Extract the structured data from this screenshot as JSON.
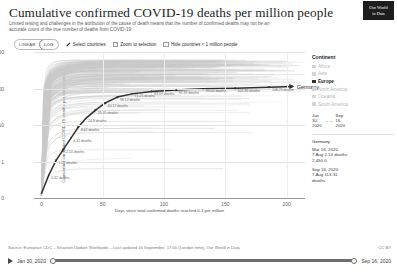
{
  "header": {
    "title": "Cumulative confirmed COVID-19 deaths per million people",
    "subtitle": "Limited testing and challenges in the attribution of the cause of death means that the number of confirmed deaths may not be an accurate count of the true number of deaths from COVID-19.",
    "logo_line1": "Our World",
    "logo_line2": "in Data"
  },
  "controls": {
    "scale_linear": "LINEAR",
    "scale_log": "LOG",
    "scale_selected": "LOG",
    "select_countries": "Select countries",
    "zoom_to_selection": "Zoom to selection",
    "hide_small_countries": "Hide countries < 1 million people",
    "zoom_checked": false,
    "hide_checked": false
  },
  "panel": {
    "legend_title": "Continent",
    "legend_items": [
      {
        "label": "Africa",
        "active": false
      },
      {
        "label": "Asia",
        "active": false
      },
      {
        "label": "Europe",
        "active": true
      },
      {
        "label": "North America",
        "active": false
      },
      {
        "label": "Oceania",
        "active": false
      },
      {
        "label": "South America",
        "active": false
      }
    ],
    "range_start_month": "Jan",
    "range_start_day": "30,",
    "range_start_year": "2020",
    "range_arrow": "←→",
    "range_end_month": "Sep",
    "range_end_day": "16,",
    "range_end_year": "2020",
    "tooltip": {
      "country": "Germany",
      "entries": [
        {
          "date": "Mar 16, 2020",
          "line1": "7 Aug 2.14 deaths",
          "line2": "2,450.0"
        },
        {
          "date": "Sep 16, 2020",
          "line1": "7 Aug 113.31",
          "line2": "deaths"
        }
      ]
    }
  },
  "footer": {
    "source": "Source: European CDC – Situation Update Worldwide – Last updated 16 September, 17:00 (London time), Our World in Data",
    "license": "CC BY",
    "time_start": "Jan 30, 2020",
    "time_end": "Sep 16, 2020"
  },
  "chart_data": {
    "type": "line",
    "title": "Cumulative confirmed COVID-19 deaths per million people",
    "xlabel": "Days since total confirmed deaths reached 0.1 per million",
    "ylabel": "Cumulative confirmed COVID-19 deaths per million people",
    "yscale": "log",
    "yticks": [
      "1,000",
      "100",
      "10",
      "1",
      "0"
    ],
    "ytick_values": [
      1000,
      100,
      10,
      1,
      0
    ],
    "xticks": [
      "0",
      "50",
      "100",
      "150",
      "200"
    ],
    "xtick_values": [
      0,
      50,
      100,
      150,
      200
    ],
    "xlim": [
      -6,
      215
    ],
    "ylim": [
      0.1,
      1000
    ],
    "grid": true,
    "legend_position": "right",
    "highlight_series": "Germany",
    "background_series_note": "grey lines: all other countries",
    "series": [
      {
        "name": "Germany",
        "color": "#2f2f2f",
        "x": [
          0,
          6,
          12,
          18,
          24,
          30,
          36,
          44,
          52,
          62,
          74,
          90,
          110,
          132,
          158,
          186,
          205
        ],
        "values": [
          0.13,
          0.42,
          1.07,
          2.14,
          4.31,
          8.62,
          14.9,
          25.15,
          40.17,
          58.12,
          71.25,
          83.09,
          91.32,
          99.02,
          101.45,
          108.25,
          113.31
        ]
      }
    ],
    "point_labels": [
      {
        "x": 6,
        "y": 0.42,
        "text": "0.42 deaths"
      },
      {
        "x": 12,
        "y": 1.07,
        "text": "1.07 deaths"
      },
      {
        "x": 18,
        "y": 2.14,
        "text": "2.14 deaths"
      },
      {
        "x": 24,
        "y": 4.31,
        "text": "4.31 deaths"
      },
      {
        "x": 30,
        "y": 8.62,
        "text": "8.62 deaths"
      },
      {
        "x": 36,
        "y": 14.9,
        "text": "14.9 deaths"
      },
      {
        "x": 44,
        "y": 25.15,
        "text": "25.15 deaths"
      },
      {
        "x": 52,
        "y": 40.17,
        "text": "40.17 deaths"
      },
      {
        "x": 62,
        "y": 58.12,
        "text": "58.12 deaths"
      },
      {
        "x": 74,
        "y": 71.25,
        "text": "71.25 deaths"
      },
      {
        "x": 90,
        "y": 83.09,
        "text": "83.09 deaths"
      },
      {
        "x": 110,
        "y": 91.32,
        "text": "91.32 deaths"
      },
      {
        "x": 132,
        "y": 99.02,
        "text": "99.02 deaths"
      },
      {
        "x": 158,
        "y": 101.45,
        "text": "101.45 deaths"
      },
      {
        "x": 186,
        "y": 108.25,
        "text": "108.25 deaths"
      }
    ],
    "end_label": "Germany"
  }
}
